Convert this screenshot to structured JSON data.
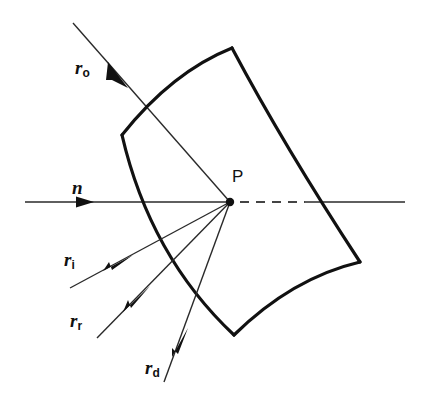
{
  "figure": {
    "background_color": "#ffffff",
    "stroke_color": "#111111",
    "labels": {
      "incident_ray": {
        "symbol": "r",
        "subscript": "o"
      },
      "normal": {
        "symbol": "n",
        "subscript": ""
      },
      "illumination_ray": {
        "symbol": "r",
        "subscript": "i"
      },
      "reflected_ray": {
        "symbol": "r",
        "subscript": "r"
      },
      "diffuse_ray": {
        "symbol": "r",
        "subscript": "d"
      },
      "intersection_point": "P"
    }
  },
  "geometry": {
    "intersection_point": {
      "x": 230,
      "y": 202
    },
    "normal_axis": {
      "x_start": 25,
      "x_end": 405,
      "y": 202,
      "arrow_x": 88,
      "dash_start": 240,
      "dash_end": 305
    },
    "surface_patch": {
      "corners": [
        {
          "name": "top-left",
          "x": 122,
          "y": 135
        },
        {
          "name": "top-right",
          "x": 232,
          "y": 48
        },
        {
          "name": "bottom-right",
          "x": 360,
          "y": 262
        },
        {
          "name": "bottom-left",
          "x": 234,
          "y": 335
        }
      ]
    },
    "rays": [
      {
        "name": "r_o",
        "from": {
          "x": 73,
          "y": 23
        },
        "to": {
          "x": 230,
          "y": 202
        },
        "arrow_at": {
          "x": 122,
          "y": 79
        },
        "direction": "into-surface"
      },
      {
        "name": "r_i",
        "from": {
          "x": 70,
          "y": 288
        },
        "to": {
          "x": 230,
          "y": 202
        },
        "arrow_at": {
          "x": 120,
          "y": 261
        },
        "direction": "toward-point"
      },
      {
        "name": "r_r",
        "from": {
          "x": 97,
          "y": 338
        },
        "to": {
          "x": 230,
          "y": 202
        },
        "arrow_at": {
          "x": 140,
          "y": 295
        },
        "direction": "toward-point"
      },
      {
        "name": "r_d",
        "from": {
          "x": 164,
          "y": 382
        },
        "to": {
          "x": 230,
          "y": 202
        },
        "arrow_at": {
          "x": 180,
          "y": 338
        },
        "direction": "toward-point"
      }
    ]
  }
}
